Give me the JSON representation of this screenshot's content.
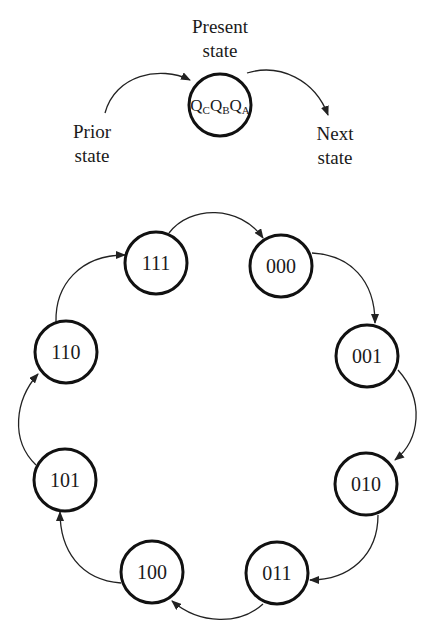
{
  "legend": {
    "present_label_line1": "Present",
    "present_label_line2": "state",
    "prior_label_line1": "Prior",
    "prior_label_line2": "state",
    "next_label_line1": "Next",
    "next_label_line2": "state",
    "node": {
      "q1": "Q",
      "s1": "C",
      "q2": "Q",
      "s2": "B",
      "q3": "Q",
      "s3": "A"
    }
  },
  "states": [
    {
      "label": "000"
    },
    {
      "label": "001"
    },
    {
      "label": "010"
    },
    {
      "label": "011"
    },
    {
      "label": "100"
    },
    {
      "label": "101"
    },
    {
      "label": "110"
    },
    {
      "label": "111"
    }
  ],
  "transitions": [
    [
      "000",
      "001"
    ],
    [
      "001",
      "010"
    ],
    [
      "010",
      "011"
    ],
    [
      "011",
      "100"
    ],
    [
      "100",
      "101"
    ],
    [
      "101",
      "110"
    ],
    [
      "110",
      "111"
    ],
    [
      "111",
      "000"
    ]
  ]
}
